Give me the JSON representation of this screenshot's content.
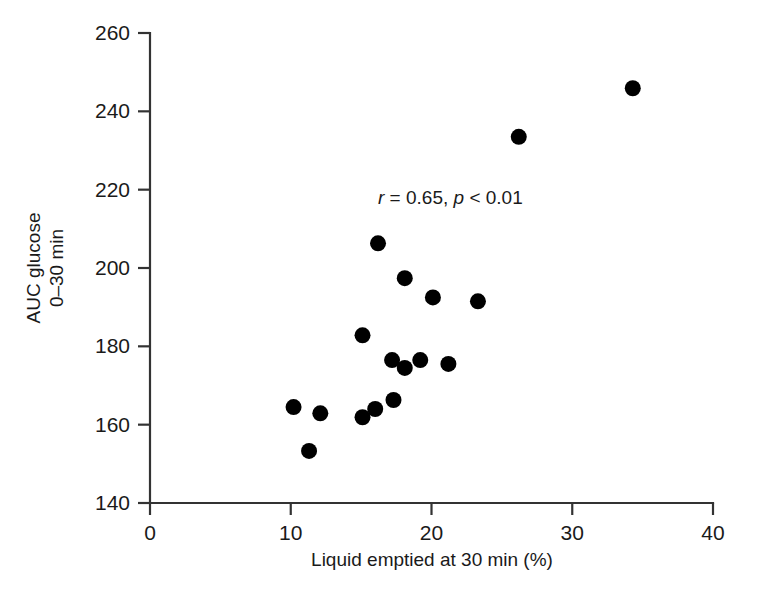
{
  "chart_data": {
    "type": "scatter",
    "title": "",
    "xlabel": "Liquid emptied at 30 min (%)",
    "ylabel_line1": "AUC glucose",
    "ylabel_line2": "0–30 min",
    "xlim": [
      0,
      40
    ],
    "ylim": [
      140,
      260
    ],
    "xticks": [
      0,
      10,
      20,
      30,
      40
    ],
    "yticks": [
      140,
      160,
      180,
      200,
      220,
      240,
      260
    ],
    "xtick_labels": [
      "0",
      "10",
      "20",
      "30",
      "40"
    ],
    "ytick_labels": [
      "140",
      "160",
      "180",
      "200",
      "220",
      "240",
      "260"
    ],
    "grid": false,
    "legend": null,
    "marker": "filled-circle",
    "marker_color": "#000000",
    "marker_size_px": 16,
    "annotations": [
      {
        "name": "correlation-stats",
        "text": "r = 0.65, p < 0.01",
        "parts": [
          {
            "t": "r",
            "italic": true
          },
          {
            "t": " = 0.65, ",
            "italic": false
          },
          {
            "t": "p",
            "italic": true
          },
          {
            "t": " < 0.01",
            "italic": false
          }
        ],
        "x": 16.2,
        "y": 218.0
      }
    ],
    "points": [
      {
        "x": 10.2,
        "y": 164.5
      },
      {
        "x": 12.1,
        "y": 162.9
      },
      {
        "x": 11.3,
        "y": 153.3
      },
      {
        "x": 15.1,
        "y": 161.9
      },
      {
        "x": 15.1,
        "y": 182.8
      },
      {
        "x": 16.2,
        "y": 206.3
      },
      {
        "x": 17.3,
        "y": 166.3
      },
      {
        "x": 17.2,
        "y": 176.5
      },
      {
        "x": 18.1,
        "y": 174.5
      },
      {
        "x": 18.1,
        "y": 197.4
      },
      {
        "x": 19.2,
        "y": 176.5
      },
      {
        "x": 20.1,
        "y": 192.5
      },
      {
        "x": 21.2,
        "y": 175.5
      },
      {
        "x": 23.3,
        "y": 191.5
      },
      {
        "x": 26.2,
        "y": 233.5
      },
      {
        "x": 34.3,
        "y": 245.9
      },
      {
        "x": 16.0,
        "y": 164.0
      }
    ],
    "series_name": "subjects",
    "n_points": 17
  }
}
